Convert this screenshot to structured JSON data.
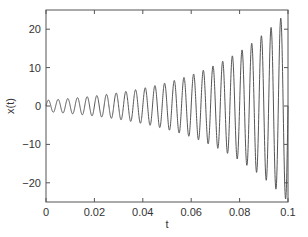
{
  "chart_data": {
    "type": "line",
    "title": "",
    "xlabel": "t",
    "ylabel": "x(t)",
    "xlim": [
      0,
      0.1
    ],
    "ylim": [
      -25,
      25
    ],
    "xticks": [
      0,
      0.02,
      0.04,
      0.06,
      0.08,
      0.1
    ],
    "xtick_labels": [
      "0",
      "0.02",
      "0.04",
      "0.06",
      "0.08",
      "0.1"
    ],
    "yticks": [
      20,
      10,
      0,
      -10,
      -20
    ],
    "ytick_labels": [
      "20",
      "10",
      "0",
      "−10",
      "−20"
    ],
    "grid": false,
    "legend": null,
    "series": [
      {
        "name": "x(t)",
        "description": "Exponentially growing sinusoid x(t) = A0 * exp(k t) * sin(2*pi*f*t)",
        "model": {
          "A0": 1.5,
          "k": 28.1,
          "f": 250
        },
        "color": "#555555",
        "envelope_samples": [
          {
            "t": 0.0,
            "amplitude": 1.5
          },
          {
            "t": 0.02,
            "amplitude": 2.6
          },
          {
            "t": 0.04,
            "amplitude": 4.6
          },
          {
            "t": 0.06,
            "amplitude": 8.1
          },
          {
            "t": 0.08,
            "amplitude": 14.2
          },
          {
            "t": 0.1,
            "amplitude": 25.0
          }
        ]
      }
    ]
  }
}
